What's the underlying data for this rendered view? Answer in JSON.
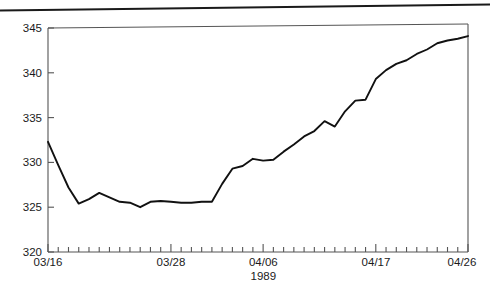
{
  "chart_data": {
    "type": "line",
    "title": "",
    "subtitle": "",
    "xlabel": "1989",
    "ylabel": "",
    "xlim": [
      "03/16",
      "04/26"
    ],
    "ylim": [
      320,
      345
    ],
    "grid": false,
    "legend": null,
    "y_ticks": [
      320,
      325,
      330,
      335,
      340,
      345
    ],
    "y_tick_labels": [
      "320",
      "325",
      "330",
      "335",
      "340",
      "345"
    ],
    "x_tick_labels": [
      "03/16",
      "03/28",
      "04/06",
      "04/17",
      "04/26"
    ],
    "x_labeled_indices": [
      0,
      12,
      21,
      32,
      41
    ],
    "x_minor_tick_count": 42,
    "line_color": "#111111",
    "axis_color": "#4a4a4a",
    "x": [
      "03/16",
      "03/17",
      "03/18",
      "03/19",
      "03/20",
      "03/21",
      "03/22",
      "03/23",
      "03/24",
      "03/25",
      "03/26",
      "03/27",
      "03/28",
      "03/29",
      "03/30",
      "03/31",
      "04/01",
      "04/02",
      "04/03",
      "04/04",
      "04/05",
      "04/06",
      "04/07",
      "04/08",
      "04/09",
      "04/10",
      "04/11",
      "04/12",
      "04/13",
      "04/14",
      "04/15",
      "04/16",
      "04/17",
      "04/18",
      "04/19",
      "04/20",
      "04/21",
      "04/22",
      "04/23",
      "04/24",
      "04/25",
      "04/26"
    ],
    "values": [
      332.3,
      329.7,
      327.2,
      325.4,
      325.9,
      326.6,
      326.1,
      325.6,
      325.5,
      325.0,
      325.6,
      325.7,
      325.6,
      325.5,
      325.5,
      325.6,
      325.6,
      327.6,
      329.3,
      329.6,
      330.4,
      330.2,
      330.3,
      331.2,
      332.0,
      332.9,
      333.5,
      334.6,
      334.0,
      335.7,
      336.9,
      337.0,
      339.3,
      340.3,
      341.0,
      341.4,
      342.1,
      342.6,
      343.3,
      343.6,
      343.8,
      344.1
    ]
  }
}
